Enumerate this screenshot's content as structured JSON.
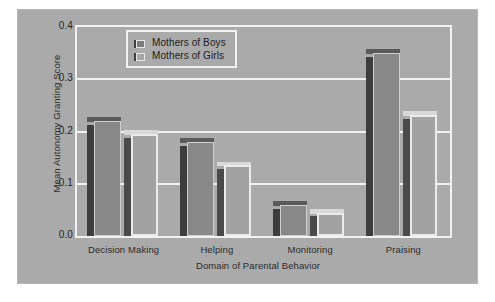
{
  "chart_data": {
    "type": "bar",
    "title": "",
    "xlabel": "Domain of Parental Behavior",
    "ylabel": "Mean Autonomy Granting Score",
    "categories": [
      "Decision Making",
      "Helping",
      "Monitoring",
      "Praising"
    ],
    "ylim": [
      0.0,
      0.4
    ],
    "yticks": [
      "0.0",
      "0.1",
      "0.2",
      "0.3",
      "0.4"
    ],
    "ytick_values": [
      0.0,
      0.1,
      0.2,
      0.3,
      0.4
    ],
    "grid": true,
    "legend_position": "top-center",
    "series": [
      {
        "name": "Mothers of Boys",
        "color": "#888888",
        "values": [
          0.22,
          0.18,
          0.06,
          0.35
        ]
      },
      {
        "name": "Mothers of Girls",
        "color": "#a2a2a2",
        "values": [
          0.195,
          0.135,
          0.045,
          0.232
        ]
      }
    ]
  },
  "legend": {
    "items": [
      {
        "label": "Mothers of Boys"
      },
      {
        "label": "Mothers of Girls"
      }
    ]
  },
  "axes": {
    "y_title": "Mean Autonomy Granting Score",
    "x_title": "Domain of Parental Behavior"
  }
}
